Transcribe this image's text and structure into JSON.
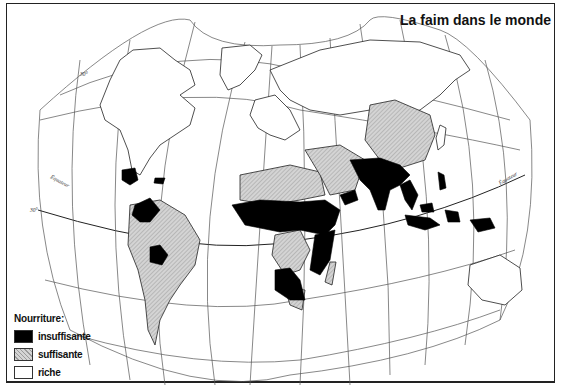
{
  "map": {
    "title": "La faim dans le monde",
    "projection": "Winkel/Aitoff-like world projection",
    "graticule_labels": {
      "equator_west": "Équateur",
      "equator_east": "Équateur",
      "lat_north": "30°",
      "lat_south": "30°"
    }
  },
  "legend": {
    "title": "Nourriture:",
    "items": [
      {
        "label": "insuffisante",
        "color": "#000000",
        "key": "insufficient"
      },
      {
        "label": "suffisante",
        "color": "#c8c8c8",
        "key": "sufficient"
      },
      {
        "label": "riche",
        "color": "#ffffff",
        "key": "rich"
      }
    ]
  },
  "regions": {
    "insufficient": [
      "Central America (Guatemala/Honduras)",
      "Haiti",
      "Colombia/Venezuela (northern South America)",
      "Bolivia",
      "Sahel & Central Africa",
      "East Africa",
      "Southern Africa",
      "Yemen",
      "South Asia (India, Pakistan, Bangladesh)",
      "Southeast Asia",
      "Indonesia",
      "Philippines"
    ],
    "sufficient": [
      "South America (Brazil, Argentina)",
      "North Africa",
      "Middle East",
      "China",
      "Central Africa (Congo)",
      "Madagascar"
    ],
    "rich": [
      "North America",
      "Europe",
      "USSR",
      "Japan",
      "Australia"
    ]
  },
  "colors": {
    "insufficient": "#000000",
    "sufficient": "#c8c8c8",
    "rich": "#ffffff",
    "outline": "#222222",
    "graticule": "#555555"
  }
}
